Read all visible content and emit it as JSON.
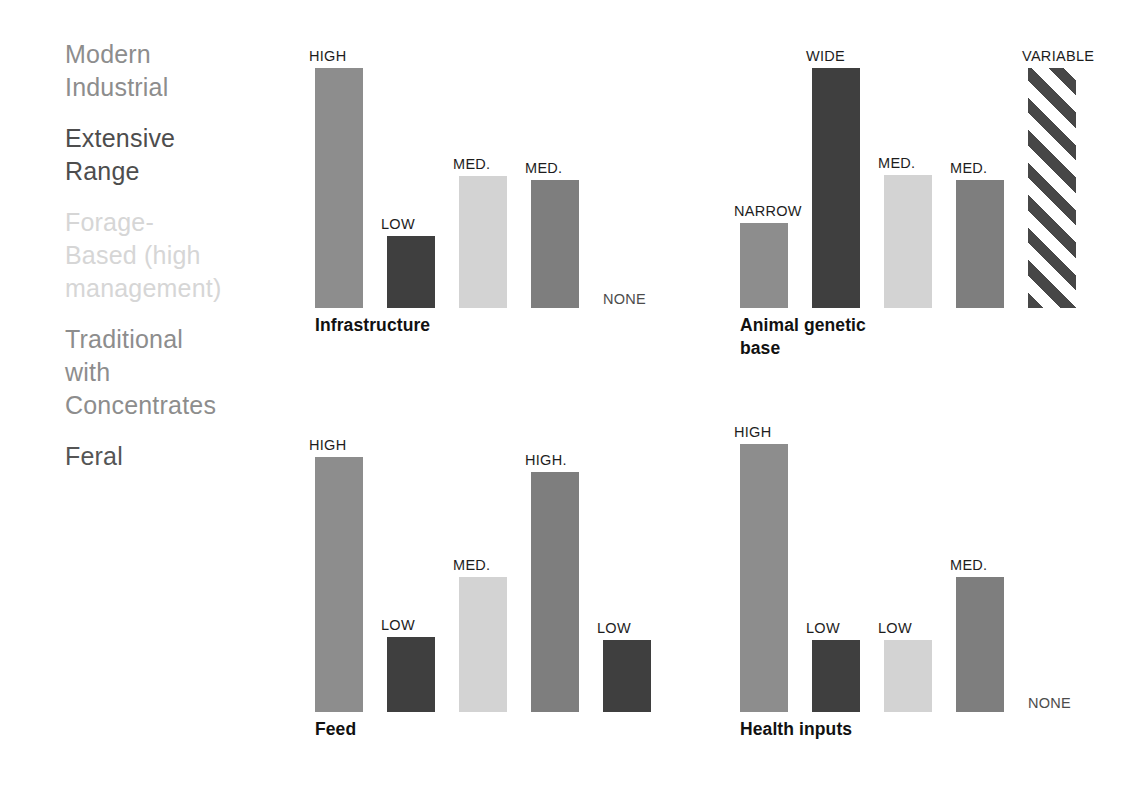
{
  "legend": {
    "items": [
      {
        "label": "Modern\nIndustrial",
        "color": "#8d8d8d"
      },
      {
        "label": "Extensive\nRange",
        "color": "#4d4d4d"
      },
      {
        "label": "Forage-\nBased (high\nmanagement)",
        "color": "#d6d6d6"
      },
      {
        "label": "Traditional\nwith\nConcentrates",
        "color": "#8d8d8d"
      },
      {
        "label": "Feral",
        "color": "#555555"
      }
    ]
  },
  "chart_data": [
    {
      "type": "bar",
      "title": "Infrastructure",
      "categories": [
        "Modern Industrial",
        "Extensive Range",
        "Forage-Based (high management)",
        "Traditional with Concentrates",
        "Feral"
      ],
      "value_labels": [
        "HIGH",
        "LOW",
        "MED.",
        "MED.",
        "NONE"
      ],
      "values": [
        240,
        72,
        132,
        128,
        0
      ],
      "colors": [
        "#8d8d8d",
        "#3f3f3f",
        "#d3d3d3",
        "#7e7e7e",
        "none"
      ],
      "fills": [
        "solid",
        "solid",
        "solid",
        "solid",
        "none"
      ],
      "ylabel": "",
      "xlabel": "",
      "grid": false
    },
    {
      "type": "bar",
      "title": "Animal genetic\nbase",
      "categories": [
        "Modern Industrial",
        "Extensive Range",
        "Forage-Based (high management)",
        "Traditional with Concentrates",
        "Feral"
      ],
      "value_labels": [
        "NARROW",
        "WIDE",
        "MED.",
        "MED.",
        "VARIABLE"
      ],
      "values": [
        85,
        240,
        133,
        128,
        240
      ],
      "colors": [
        "#8d8d8d",
        "#3f3f3f",
        "#d3d3d3",
        "#7e7e7e",
        "#474747"
      ],
      "fills": [
        "solid",
        "solid",
        "solid",
        "solid",
        "hatch"
      ],
      "ylabel": "",
      "xlabel": "",
      "grid": false
    },
    {
      "type": "bar",
      "title": "Feed",
      "categories": [
        "Modern Industrial",
        "Extensive Range",
        "Forage-Based (high management)",
        "Traditional with Concentrates",
        "Feral"
      ],
      "value_labels": [
        "HIGH",
        "LOW",
        "MED.",
        "HIGH.",
        "LOW"
      ],
      "values": [
        255,
        75,
        135,
        240,
        72
      ],
      "colors": [
        "#8d8d8d",
        "#3f3f3f",
        "#d3d3d3",
        "#7e7e7e",
        "#3f3f3f"
      ],
      "fills": [
        "solid",
        "solid",
        "solid",
        "solid",
        "solid"
      ],
      "ylabel": "",
      "xlabel": "",
      "grid": false
    },
    {
      "type": "bar",
      "title": "Health inputs",
      "categories": [
        "Modern Industrial",
        "Extensive Range",
        "Forage-Based (high management)",
        "Traditional with Concentrates",
        "Feral"
      ],
      "value_labels": [
        "HIGH",
        "LOW",
        "LOW",
        "MED.",
        "NONE"
      ],
      "values": [
        268,
        72,
        72,
        135,
        0
      ],
      "colors": [
        "#8d8d8d",
        "#3f3f3f",
        "#d3d3d3",
        "#7e7e7e",
        "none"
      ],
      "fills": [
        "solid",
        "solid",
        "solid",
        "solid",
        "none"
      ],
      "ylabel": "",
      "xlabel": "",
      "grid": false
    }
  ]
}
